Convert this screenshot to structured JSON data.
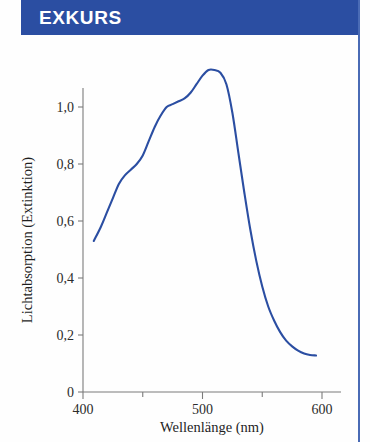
{
  "header": {
    "title": "EXKURS",
    "bar_color": "#2b4ea2",
    "text_color": "#ffffff"
  },
  "rule": {
    "color": "#4a6bb5"
  },
  "chart_data": {
    "type": "line",
    "title": "",
    "subtitle": "",
    "xlabel": "Wellenlänge (nm)",
    "ylabel": "Lichtabsorption (Extinktion)",
    "xlim": [
      400,
      600
    ],
    "ylim": [
      0,
      1.2
    ],
    "xticks": [
      400,
      450,
      500,
      550,
      600
    ],
    "xticklabels": [
      "400",
      "",
      "500",
      "",
      "600"
    ],
    "yticks": [
      0,
      0.2,
      0.4,
      0.6,
      0.8,
      1.0
    ],
    "yticklabels": [
      "0",
      "0,2",
      "0,4",
      "0,6",
      "0,8",
      "1,0"
    ],
    "grid": false,
    "legend": null,
    "series": [
      {
        "name": "Absorptionsspektrum",
        "color": "#2b4ea2",
        "x": [
          409,
          415,
          420,
          425,
          430,
          435,
          440,
          445,
          450,
          455,
          460,
          465,
          470,
          475,
          480,
          485,
          490,
          495,
          500,
          505,
          510,
          515,
          520,
          525,
          530,
          535,
          540,
          545,
          550,
          555,
          560,
          565,
          570,
          575,
          580,
          585,
          590,
          595
        ],
        "y": [
          0.53,
          0.58,
          0.63,
          0.68,
          0.73,
          0.76,
          0.78,
          0.8,
          0.83,
          0.88,
          0.93,
          0.97,
          1.0,
          1.01,
          1.02,
          1.03,
          1.05,
          1.08,
          1.11,
          1.13,
          1.13,
          1.12,
          1.08,
          0.98,
          0.84,
          0.7,
          0.57,
          0.46,
          0.37,
          0.3,
          0.25,
          0.21,
          0.18,
          0.16,
          0.145,
          0.135,
          0.13,
          0.128
        ]
      }
    ]
  }
}
